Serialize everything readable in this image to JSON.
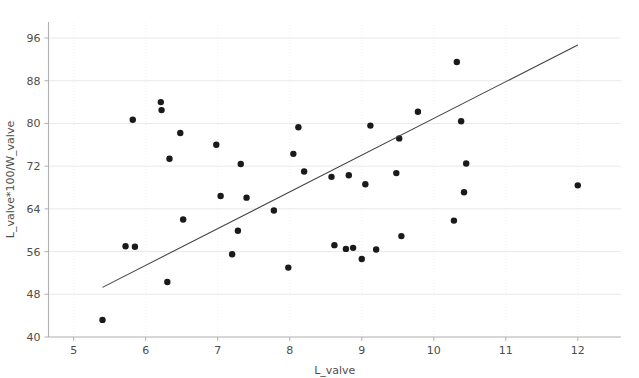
{
  "chart_data": {
    "type": "scatter",
    "title": "",
    "xlabel": "L_valve",
    "ylabel": "L_valve*100/W_valve",
    "xlim": [
      4.65,
      12.6
    ],
    "ylim": [
      40,
      99
    ],
    "xticks": [
      5,
      6,
      7,
      8,
      9,
      10,
      11,
      12
    ],
    "yticks": [
      40,
      48,
      56,
      64,
      72,
      80,
      88,
      96
    ],
    "grid": true,
    "legend": null,
    "marker": {
      "shape": "circle",
      "color": "#1a1a1a",
      "size": 3.2
    },
    "points": [
      {
        "x": 5.4,
        "y": 43.2
      },
      {
        "x": 5.72,
        "y": 57.0
      },
      {
        "x": 5.82,
        "y": 80.7
      },
      {
        "x": 5.85,
        "y": 56.9
      },
      {
        "x": 6.21,
        "y": 84.0
      },
      {
        "x": 6.22,
        "y": 82.5
      },
      {
        "x": 6.3,
        "y": 50.3
      },
      {
        "x": 6.33,
        "y": 73.4
      },
      {
        "x": 6.48,
        "y": 78.2
      },
      {
        "x": 6.52,
        "y": 62.0
      },
      {
        "x": 6.98,
        "y": 76.0
      },
      {
        "x": 7.04,
        "y": 66.4
      },
      {
        "x": 7.2,
        "y": 55.5
      },
      {
        "x": 7.28,
        "y": 59.9
      },
      {
        "x": 7.32,
        "y": 72.4
      },
      {
        "x": 7.4,
        "y": 66.1
      },
      {
        "x": 7.78,
        "y": 63.7
      },
      {
        "x": 7.98,
        "y": 53.0
      },
      {
        "x": 8.05,
        "y": 74.3
      },
      {
        "x": 8.12,
        "y": 79.3
      },
      {
        "x": 8.2,
        "y": 71.0
      },
      {
        "x": 8.58,
        "y": 70.0
      },
      {
        "x": 8.62,
        "y": 57.2
      },
      {
        "x": 8.78,
        "y": 56.5
      },
      {
        "x": 8.82,
        "y": 70.3
      },
      {
        "x": 8.88,
        "y": 56.7
      },
      {
        "x": 9.0,
        "y": 54.6
      },
      {
        "x": 9.05,
        "y": 68.6
      },
      {
        "x": 9.12,
        "y": 79.6
      },
      {
        "x": 9.2,
        "y": 56.4
      },
      {
        "x": 9.48,
        "y": 70.7
      },
      {
        "x": 9.52,
        "y": 77.2
      },
      {
        "x": 9.55,
        "y": 58.9
      },
      {
        "x": 9.78,
        "y": 82.2
      },
      {
        "x": 10.28,
        "y": 61.8
      },
      {
        "x": 10.32,
        "y": 91.5
      },
      {
        "x": 10.38,
        "y": 80.4
      },
      {
        "x": 10.42,
        "y": 67.1
      },
      {
        "x": 10.45,
        "y": 72.5
      },
      {
        "x": 12.0,
        "y": 68.4
      }
    ],
    "trendline": {
      "type": "linear",
      "x_start": 5.4,
      "y_start": 49.3,
      "x_end": 12.0,
      "y_end": 94.7
    }
  },
  "axes": {
    "x_tick_labels": [
      "5",
      "6",
      "7",
      "8",
      "9",
      "10",
      "11",
      "12"
    ],
    "y_tick_labels": [
      "40",
      "48",
      "56",
      "64",
      "72",
      "80",
      "88",
      "96"
    ],
    "x_axis_title": "L_valve",
    "y_axis_title": "L_valve*100/W_valve"
  },
  "colors": {
    "point": "#1a1a1a",
    "trendline": "#3f3f3f",
    "grid": "#e9e9e9",
    "spine": "#b0b0b0",
    "text": "#4d4d4d",
    "background": "#ffffff"
  }
}
